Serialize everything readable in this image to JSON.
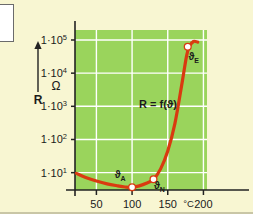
{
  "figure": {
    "background_color": "#f8f6d2",
    "plot_background_color": "#9ad45c",
    "grid_color": "#ffffff",
    "axis_color": "#222222",
    "curve_color": "#d93a10",
    "marker_fill": "#ffffff",
    "marker_stroke": "#d93a10"
  },
  "callout": {
    "name": "clipped-white-box"
  },
  "chart_data": {
    "type": "line",
    "title": "",
    "subtitle": "",
    "xlabel": "",
    "ylabel": "R",
    "y_unit": "Ω",
    "x_unit": "°C",
    "yscale": "log",
    "xscale": "linear",
    "xlim": [
      20,
      205
    ],
    "ylim": [
      3,
      200000
    ],
    "grid": true,
    "legend_position": "none",
    "annotation": "R = f(ϑ)",
    "x_ticks": [
      {
        "value": 50,
        "label": "50"
      },
      {
        "value": 100,
        "label": "100"
      },
      {
        "value": 150,
        "label": "150"
      },
      {
        "value": 200,
        "label": "200"
      }
    ],
    "x_unit_label": "°C",
    "y_ticks": [
      {
        "value": 10,
        "mantissa": "1·10",
        "exponent": "1"
      },
      {
        "value": 100,
        "mantissa": "1·10",
        "exponent": "2"
      },
      {
        "value": 1000,
        "mantissa": "1·10",
        "exponent": "3"
      },
      {
        "value": 10000,
        "mantissa": "1·10",
        "exponent": "4"
      },
      {
        "value": 100000,
        "mantissa": "1·10",
        "exponent": "5"
      }
    ],
    "series": [
      {
        "name": "R = f(ϑ)",
        "x": [
          22,
          35,
          50,
          65,
          80,
          90,
          100,
          110,
          120,
          130,
          140,
          150,
          160,
          170,
          176,
          180,
          186,
          192
        ],
        "y": [
          9.5,
          7.2,
          5.6,
          4.6,
          4.0,
          3.7,
          3.6,
          4.0,
          4.8,
          6.3,
          13,
          45,
          300,
          5000,
          30000,
          62000,
          90000,
          86000
        ]
      }
    ],
    "points": [
      {
        "label": "ϑ",
        "sub": "A",
        "x": 100,
        "y": 3.6,
        "label_dx": -12,
        "label_dy": -9
      },
      {
        "label": "ϑ",
        "sub": "N",
        "x": 130,
        "y": 6.3,
        "label_dx": 6,
        "label_dy": 10
      },
      {
        "label": "ϑ",
        "sub": "E",
        "x": 178,
        "y": 62000,
        "label_dx": 6,
        "label_dy": 13
      }
    ]
  }
}
